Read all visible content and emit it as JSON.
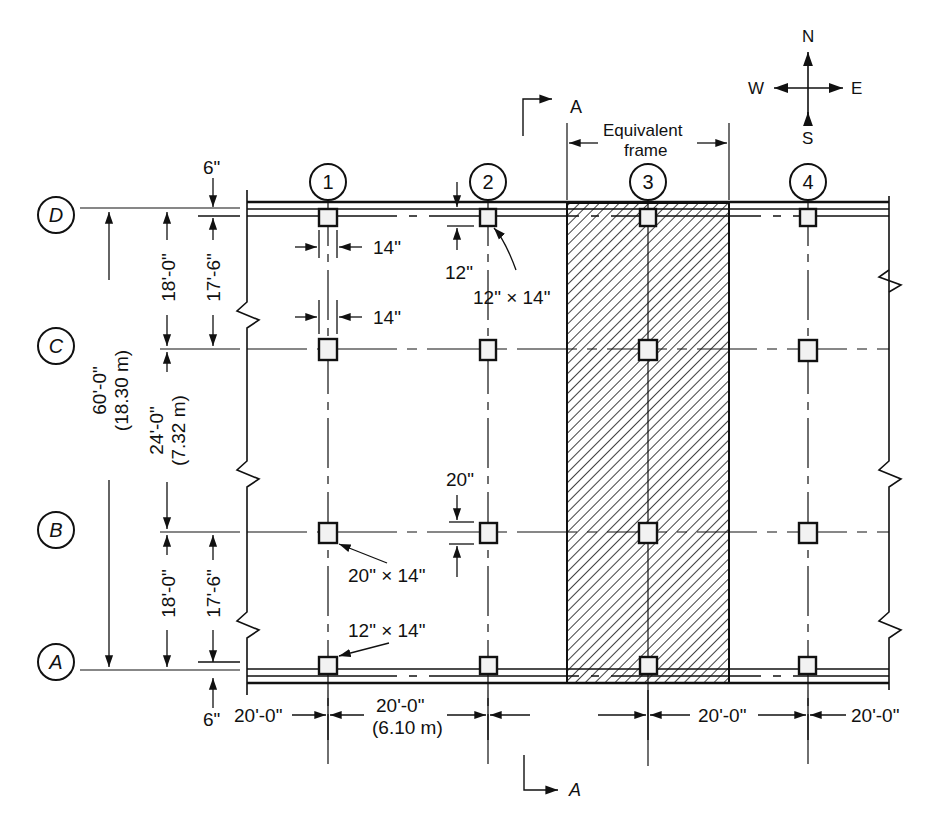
{
  "compass": {
    "north": "N",
    "south": "S",
    "east": "E",
    "west": "W"
  },
  "section_marker": {
    "label": "A"
  },
  "equivalent_frame": {
    "label_line1": "Equivalent",
    "label_line2": "frame",
    "hatch_color": "#111111"
  },
  "grid": {
    "columns": [
      {
        "id": "1",
        "label": "1"
      },
      {
        "id": "2",
        "label": "2"
      },
      {
        "id": "3",
        "label": "3"
      },
      {
        "id": "4",
        "label": "4"
      }
    ],
    "rows": [
      {
        "id": "D",
        "label": "D"
      },
      {
        "id": "C",
        "label": "C"
      },
      {
        "id": "B",
        "label": "B"
      },
      {
        "id": "A",
        "label": "A"
      }
    ]
  },
  "vertical_dimensions": {
    "overall": {
      "value": "60'-0\"",
      "metric": "(18.30 m)"
    },
    "span_DC": "18'-0\"",
    "span_CB": {
      "value": "24'-0\"",
      "metric": "(7.32 m)"
    },
    "span_BA": "18'-0\"",
    "clear_DC": "17'-6\"",
    "clear_BA": "17'-6\"",
    "top_offset": "6\"",
    "bottom_offset": "6\""
  },
  "horizontal_dimensions": {
    "left_overhang": "20'-0\"",
    "span_12": {
      "value": "20'-0\"",
      "metric": "(6.10 m)"
    },
    "span_23": "20'-0\"",
    "span_34": "20'-0\"",
    "right_overhang": "20'-0\""
  },
  "column_annotations": {
    "col_width_top": "14\"",
    "col_width_mid": "14\"",
    "edge_beam_depth": "12\"",
    "edge_column_size": "12\" × 14\"",
    "interior_column_depth": "20\"",
    "interior_column_size": "20\" × 14\"",
    "bottom_edge_column_size": "12\" × 14\""
  }
}
